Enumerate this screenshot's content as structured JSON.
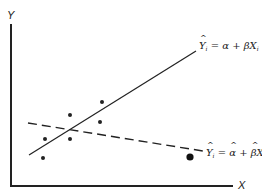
{
  "axes": {
    "y_label": "Y",
    "x_label": "X"
  },
  "lines": {
    "solid": {
      "equation_lhs": "Y",
      "equation_sub": "i",
      "equation_rhs_alpha": "α",
      "equation_plus": "+",
      "equation_rhs_beta": "β",
      "equation_rhs_x": "X",
      "equation_x_sub": "i",
      "equals": "=",
      "style": "solid"
    },
    "dashed": {
      "equation_lhs": "Y",
      "equation_sub": "i",
      "equation_rhs_alpha": "α",
      "equation_plus": "+",
      "equation_rhs_beta": "β",
      "equation_rhs_x": "X",
      "equation_x_sub": "i",
      "equals": "=",
      "style": "dashed"
    }
  },
  "points": [
    {
      "x": 43,
      "y": 158,
      "size": "small"
    },
    {
      "x": 45,
      "y": 139,
      "size": "small"
    },
    {
      "x": 70,
      "y": 139,
      "size": "small"
    },
    {
      "x": 70,
      "y": 115,
      "size": "small"
    },
    {
      "x": 100,
      "y": 122,
      "size": "small"
    },
    {
      "x": 102,
      "y": 102,
      "size": "small"
    },
    {
      "x": 190,
      "y": 157,
      "size": "large"
    }
  ],
  "colors": {
    "ink": "#222222",
    "background": "#ffffff"
  }
}
